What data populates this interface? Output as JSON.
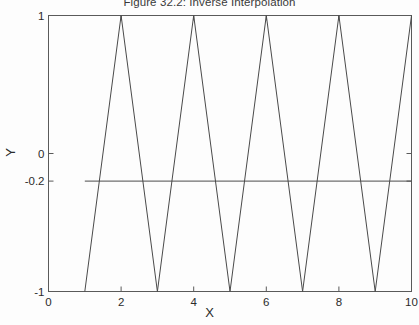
{
  "chart_data": {
    "type": "line",
    "title": "Figure 32.2: Inverse Interpolation",
    "xlabel": "X",
    "ylabel": "Y",
    "xlim": [
      0,
      10
    ],
    "ylim": [
      -1,
      1
    ],
    "xticks": [
      0,
      2,
      4,
      6,
      8,
      10
    ],
    "xticklabels": [
      "0",
      "2",
      "4",
      "6",
      "8",
      "10"
    ],
    "yticks": [
      1,
      0,
      -0.2,
      -1
    ],
    "yticklabels": [
      "1",
      "0",
      "-0.2",
      "-1"
    ],
    "grid": false,
    "legend": null,
    "series": [
      {
        "name": "triangle-wave",
        "type": "line",
        "color": "#4a4a4a",
        "x": [
          1,
          2,
          3,
          4,
          5,
          6,
          7,
          8,
          9,
          10
        ],
        "y": [
          -1,
          1,
          -1,
          1,
          -1,
          1,
          -1,
          1,
          -1,
          1
        ]
      },
      {
        "name": "reference-level",
        "type": "line",
        "color": "#4a4a4a",
        "x": [
          1,
          10
        ],
        "y": [
          -0.2,
          -0.2
        ]
      }
    ],
    "annotations": [
      {
        "name": "reference-level-value",
        "text": "-0.2",
        "y": -0.2
      }
    ]
  },
  "figure": {
    "background": "#fdfdfd",
    "axes_color": "#5a5a5a",
    "line_color": "#4a4a4a"
  }
}
